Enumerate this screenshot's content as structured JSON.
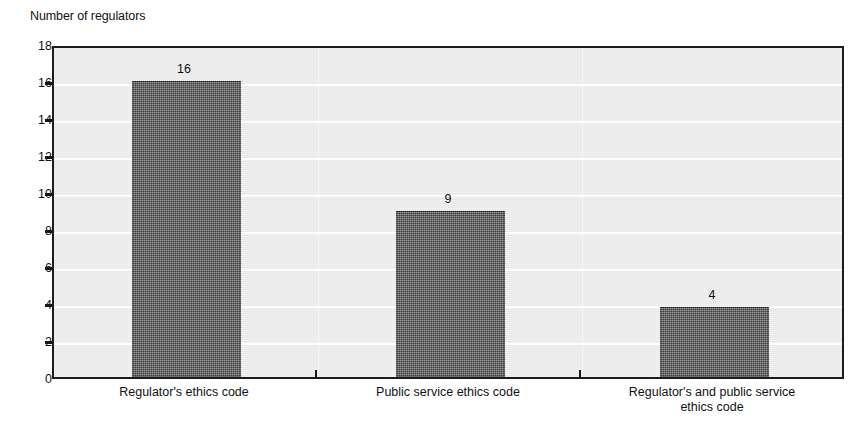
{
  "chart_data": {
    "type": "bar",
    "title": "",
    "subtitle": "",
    "xlabel": "",
    "ylabel": "Number of regulators",
    "ylim": [
      0,
      18
    ],
    "ytick_step": 2,
    "yticks": [
      "18",
      "16",
      "14",
      "12",
      "10",
      "8",
      "6",
      "4",
      "2",
      "0"
    ],
    "categories": [
      "Regulator's ethics code",
      "Public service ethics code",
      "Regulator's and public service ethics code"
    ],
    "category_label_lines": [
      [
        "Regulator's ethics code"
      ],
      [
        "Public service ethics code"
      ],
      [
        "Regulator's and public service",
        "ethics code"
      ]
    ],
    "values": [
      16,
      9,
      4
    ],
    "value_labels": [
      "16",
      "9",
      "4"
    ],
    "bar_plot_heights": [
      16,
      9,
      3.8
    ],
    "grid": true,
    "gridline_color": "#fdfdfd",
    "legend": null,
    "legend_position": "none",
    "series": [
      {
        "name": "Number of regulators",
        "values": [
          16,
          9,
          4
        ],
        "color": "#3b3b3b"
      }
    ],
    "colors": {
      "bar": "#3b3b3b",
      "bar_border": "#151515",
      "plot_background": "#e7e7e7",
      "frame": "#1c1c1c",
      "text": "#121212",
      "page_background": "#ffffff"
    }
  }
}
